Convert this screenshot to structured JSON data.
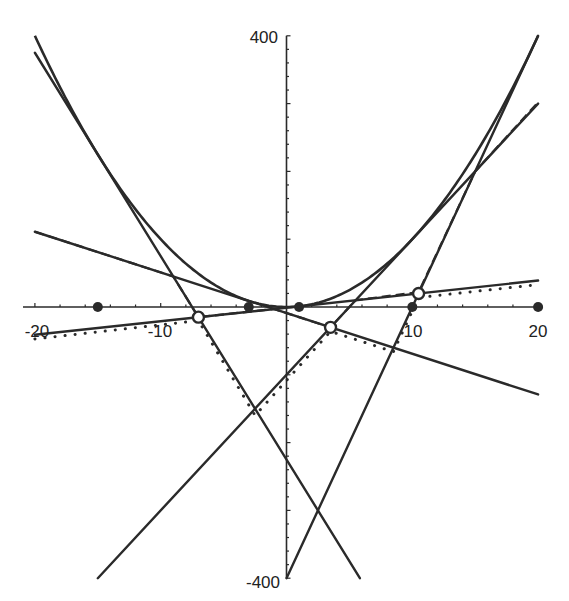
{
  "chart_data": {
    "type": "line",
    "title": "",
    "xlabel": "",
    "ylabel": "",
    "xlim": [
      -20,
      20
    ],
    "ylim": [
      -400,
      400
    ],
    "grid": false,
    "x_tick_labels": [
      "-20",
      "-10",
      "10",
      "20"
    ],
    "y_tick_labels": [
      "400",
      "-400"
    ],
    "x_ticks_minor_step": 2,
    "y_ticks_minor_step": 20,
    "curve": {
      "name": "parabola",
      "equation": "y = x^2",
      "x_range": [
        -20,
        20
      ]
    },
    "tangent_points": [
      -15,
      -3,
      1,
      10,
      20
    ],
    "tangent_lines": [
      {
        "name": "tangent at x=-15",
        "slope": -30,
        "intercept": -225,
        "x_range": [
          -20,
          5.833
        ]
      },
      {
        "name": "tangent at x=-3",
        "slope": -6,
        "intercept": -9,
        "x_range": [
          -20,
          20
        ]
      },
      {
        "name": "tangent at x=1",
        "slope": 2,
        "intercept": -1,
        "x_range": [
          -20,
          20
        ]
      },
      {
        "name": "tangent at x=10",
        "slope": 20,
        "intercept": -100,
        "x_range": [
          -15,
          20
        ]
      },
      {
        "name": "tangent at x=20",
        "slope": 40,
        "intercept": -400,
        "x_range": [
          0,
          20
        ]
      }
    ],
    "open_circles": [
      {
        "x": -7,
        "y": -15
      },
      {
        "x": 3.5,
        "y": -30
      },
      {
        "x": 10.5,
        "y": 20
      }
    ],
    "dashed_polyline": [
      [
        -20,
        111
      ],
      [
        -9,
        45
      ],
      [
        -7,
        -15
      ],
      [
        -1,
        -3
      ],
      [
        3.5,
        -30
      ],
      [
        5.5,
        10
      ],
      [
        10.5,
        22
      ],
      [
        15,
        200
      ],
      [
        20,
        302
      ]
    ],
    "dotted_polyline": [
      [
        -20,
        -47
      ],
      [
        -7,
        -20
      ],
      [
        -2.5,
        -160
      ],
      [
        3.5,
        -36
      ],
      [
        8.5,
        -66
      ],
      [
        10.5,
        14
      ],
      [
        20,
        33
      ]
    ]
  },
  "axes": {
    "y_top_label": "400",
    "y_bottom_label": "-400",
    "x_labels": [
      "-20",
      "-10",
      "10",
      "20"
    ]
  }
}
